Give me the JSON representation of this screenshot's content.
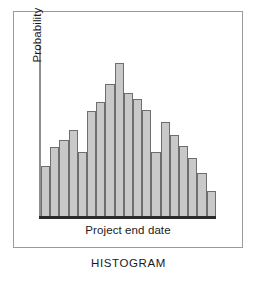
{
  "figure": {
    "caption": "HISTOGRAM",
    "frame_color": "#9a9a9a",
    "background_color": "#ffffff"
  },
  "chart_data": {
    "type": "bar",
    "title": "HISTOGRAM",
    "xlabel": "Project end date",
    "ylabel": "Probability",
    "categories": [
      "1",
      "2",
      "3",
      "4",
      "5",
      "6",
      "7",
      "8",
      "9",
      "10",
      "11",
      "12",
      "13",
      "14",
      "15",
      "16",
      "17",
      "18",
      "19"
    ],
    "values": [
      41,
      56,
      62,
      70,
      52,
      85,
      93,
      107,
      124,
      100,
      95,
      86,
      52,
      76,
      66,
      57,
      47,
      35,
      20
    ],
    "ylim": [
      0,
      130
    ],
    "xlim": [
      0,
      19
    ],
    "grid": false,
    "legend": null,
    "tick_labels": {
      "x": [],
      "y": []
    },
    "bar_fill_color": "#c9c9c9",
    "bar_edge_color": "#6e6e6e",
    "axis_color": "#2a2a2a",
    "annotations": []
  },
  "axes": {
    "y_title": "Probability",
    "x_title": "Project end date"
  }
}
